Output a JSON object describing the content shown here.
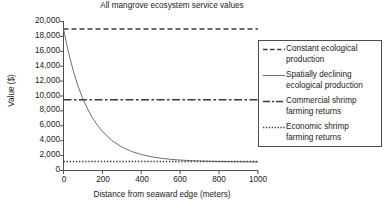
{
  "chart_data": {
    "type": "line",
    "title": "All mangrove ecosystem service values",
    "xlabel": "Distance from seaward edge (meters)",
    "ylabel": "Value ($)",
    "xlim": [
      0,
      1000
    ],
    "ylim": [
      0,
      20000
    ],
    "xticks": [
      0,
      200,
      400,
      600,
      800,
      1000
    ],
    "xtick_labels": [
      "0",
      "200",
      "400",
      "600",
      "800",
      "1000"
    ],
    "yticks": [
      0,
      2000,
      4000,
      6000,
      8000,
      10000,
      12000,
      14000,
      16000,
      18000,
      20000
    ],
    "ytick_labels": [
      "0",
      "2,000",
      "4,000",
      "6,000",
      "8,000",
      "10,000",
      "12,000",
      "14,000",
      "16,000",
      "18,000",
      "20,000"
    ],
    "grid": false,
    "legend_position": "right",
    "series": [
      {
        "name": "Constant ecological production",
        "style": "dashed",
        "color": "#3b3b3b",
        "x": [
          0,
          1000
        ],
        "values": [
          19000,
          19000
        ]
      },
      {
        "name": "Spatially declining ecological production",
        "style": "solid",
        "color": "#6e6e6e",
        "x": [
          0,
          25,
          50,
          75,
          100,
          125,
          150,
          175,
          200,
          250,
          300,
          350,
          400,
          450,
          500,
          550,
          600,
          650,
          700,
          750,
          800,
          850,
          900,
          950,
          1000
        ],
        "values": [
          19000,
          15900,
          13400,
          11300,
          9600,
          8200,
          7000,
          6050,
          5250,
          4000,
          3150,
          2550,
          2150,
          1850,
          1650,
          1500,
          1400,
          1330,
          1280,
          1240,
          1210,
          1190,
          1170,
          1160,
          1150
        ]
      },
      {
        "name": "Commercial shrimp farming returns",
        "style": "dashdot",
        "color": "#3b3b3b",
        "x": [
          0,
          1000
        ],
        "values": [
          9500,
          9500
        ]
      },
      {
        "name": "Economic shrimp farming returns",
        "style": "dotted",
        "color": "#3b3b3b",
        "x": [
          0,
          1000
        ],
        "values": [
          1200,
          1200
        ]
      }
    ]
  },
  "legend": {
    "entries": [
      {
        "label_line1": "Constant ecological",
        "label_line2": "production",
        "style": "dashed"
      },
      {
        "label_line1": "Spatially declining",
        "label_line2": "ecological production",
        "style": "solid"
      },
      {
        "label_line1": "Commercial shrimp",
        "label_line2": "farming returns",
        "style": "dashdot"
      },
      {
        "label_line1": "Economic shrimp",
        "label_line2": "farming returns",
        "style": "dotted"
      }
    ]
  }
}
